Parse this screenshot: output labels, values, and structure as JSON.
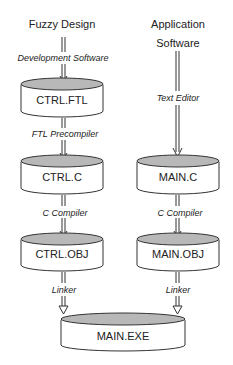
{
  "diagram": {
    "sources": {
      "left": "Fuzzy Design",
      "right_line1": "Application",
      "right_line2": "Software"
    },
    "edge_labels": {
      "dev_software": "Development Software",
      "text_editor": "Text Editor",
      "ftl_precompiler": "FTL Precompiler",
      "c_compiler_left": "C Compiler",
      "c_compiler_right": "C Compiler",
      "linker_left": "Linker",
      "linker_right": "Linker"
    },
    "files": {
      "ctrl_ftl": "CTRL.FTL",
      "ctrl_c": "CTRL.C",
      "main_c": "MAIN.C",
      "ctrl_obj": "CTRL.OBJ",
      "main_obj": "MAIN.OBJ",
      "main_exe": "MAIN.EXE"
    },
    "colors": {
      "cylinder_top": "#b8b8b8",
      "stroke": "#333333"
    }
  }
}
